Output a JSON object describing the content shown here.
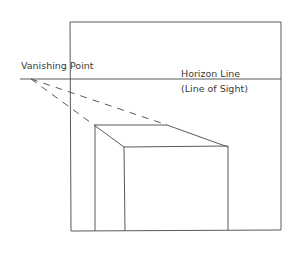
{
  "diagram": {
    "labels": {
      "vanishing_point": "Vanishing Point",
      "horizon_line": "Horizon Line",
      "line_of_sight": "(Line of Sight)"
    },
    "colors": {
      "stroke": "#5a5a5a",
      "text": "#3a3a3a",
      "background": "#ffffff"
    }
  }
}
